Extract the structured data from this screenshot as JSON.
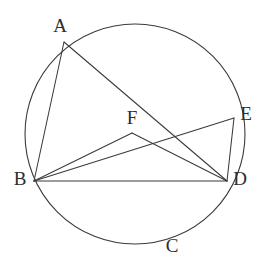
{
  "figure": {
    "background_color": "#ffffff",
    "stroke_color": "#3a3a3a",
    "label_color": "#2e2e2e"
  },
  "circle": {
    "name": "circumscribed-circle",
    "cx": 135,
    "cy": 134,
    "r": 110
  },
  "points": [
    {
      "id": "A",
      "label": "A",
      "x": 64,
      "y": 42,
      "label_x": 60,
      "label_y": 28,
      "on_circle": true
    },
    {
      "id": "B",
      "label": "B",
      "x": 34,
      "y": 181,
      "label_x": 20,
      "label_y": 181,
      "on_circle": true
    },
    {
      "id": "C",
      "label": "C",
      "x": 160,
      "y": 242,
      "label_x": 172,
      "label_y": 248,
      "on_circle": true
    },
    {
      "id": "D",
      "label": "D",
      "x": 227,
      "y": 181,
      "label_x": 240,
      "label_y": 181,
      "on_circle": true
    },
    {
      "id": "E",
      "label": "E",
      "x": 234,
      "y": 118,
      "label_x": 246,
      "label_y": 116,
      "on_circle": true
    },
    {
      "id": "F",
      "label": "F",
      "x": 132,
      "y": 133,
      "label_x": 132,
      "label_y": 120,
      "on_circle": false
    }
  ],
  "segments": [
    {
      "id": "AB",
      "from": "A",
      "to": "B",
      "x1": 64,
      "y1": 42,
      "x2": 34,
      "y2": 181
    },
    {
      "id": "AD",
      "from": "A",
      "to": "D",
      "x1": 64,
      "y1": 42,
      "x2": 227,
      "y2": 181
    },
    {
      "id": "BD",
      "from": "B",
      "to": "D",
      "x1": 34,
      "y1": 181,
      "x2": 227,
      "y2": 181
    },
    {
      "id": "BE",
      "from": "B",
      "to": "E",
      "x1": 34,
      "y1": 181,
      "x2": 234,
      "y2": 118
    },
    {
      "id": "BF",
      "from": "B",
      "to": "F",
      "x1": 34,
      "y1": 181,
      "x2": 132,
      "y2": 133
    },
    {
      "id": "FD",
      "from": "F",
      "to": "D",
      "x1": 132,
      "y1": 133,
      "x2": 227,
      "y2": 181
    },
    {
      "id": "ED",
      "from": "E",
      "to": "D",
      "x1": 234,
      "y1": 118,
      "x2": 227,
      "y2": 181
    }
  ]
}
